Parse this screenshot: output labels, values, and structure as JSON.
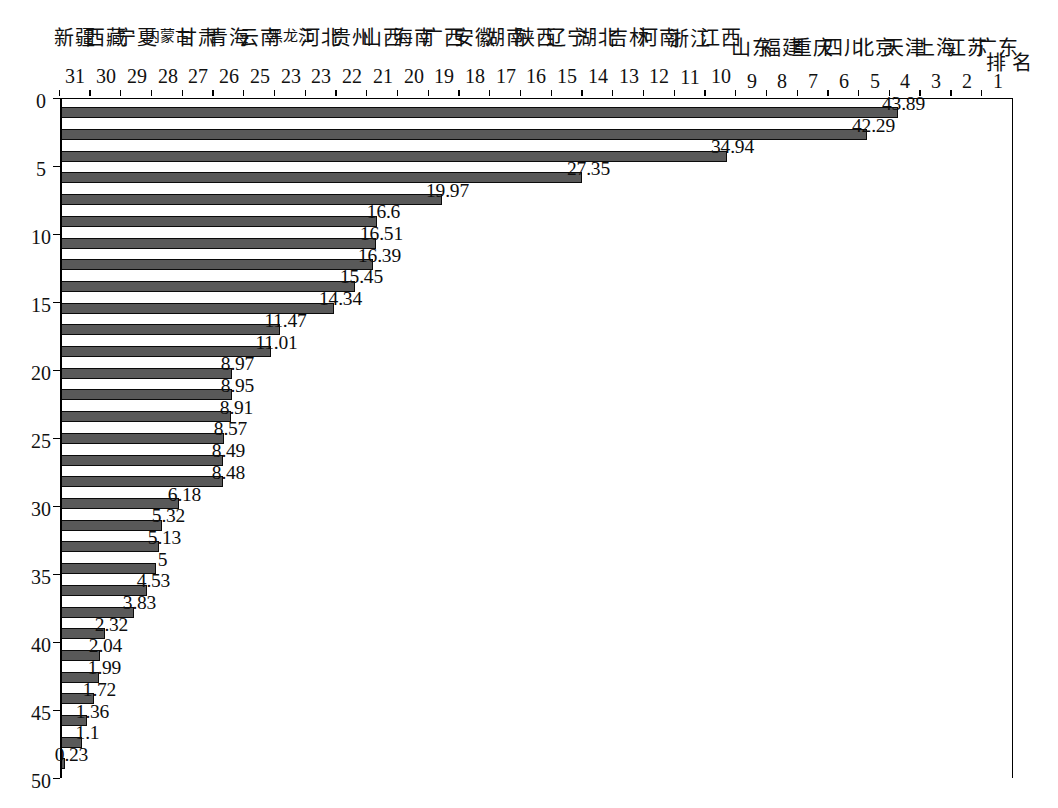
{
  "chart_data": {
    "type": "bar",
    "title": "",
    "orientation": "vertical-rotated-90ccw",
    "xlabel": "排 名",
    "ylabel": "比重（%）",
    "ylim": [
      0,
      50
    ],
    "ytick_step": 5,
    "yticks": [
      "0",
      "5",
      "10",
      "15",
      "20",
      "25",
      "30",
      "35",
      "40",
      "45",
      "50"
    ],
    "grid": false,
    "legend": null,
    "bar_color": "#595959",
    "bar_border_color": "#0b0b0b",
    "ranks": [
      "1",
      "2",
      "3",
      "4",
      "5",
      "6",
      "7",
      "8",
      "9",
      "10",
      "11",
      "12",
      "13",
      "14",
      "15",
      "16",
      "17",
      "18",
      "19",
      "20",
      "21",
      "22",
      "23",
      "23",
      "25",
      "26",
      "27",
      "28",
      "29",
      "30",
      "31"
    ],
    "categories": [
      "广东",
      "江苏",
      "上海",
      "天津",
      "北京",
      "四川",
      "重庆",
      "福建",
      "山东",
      "江西",
      "浙江",
      "河南",
      "吉林",
      "湖北",
      "辽宁",
      "陕西",
      "湖南",
      "安徽",
      "广西",
      "海南",
      "山西",
      "贵州",
      "河北",
      "黑龙江",
      "云南",
      "青海",
      "甘肃",
      "内蒙古",
      "宁夏",
      "西藏",
      "新疆"
    ],
    "values": [
      43.89,
      42.29,
      34.94,
      27.35,
      19.97,
      16.6,
      16.51,
      16.39,
      15.45,
      14.34,
      11.47,
      11.01,
      8.97,
      8.95,
      8.91,
      8.57,
      8.49,
      8.48,
      6.18,
      5.32,
      5.13,
      5,
      4.53,
      3.83,
      2.32,
      2.04,
      1.99,
      1.72,
      1.36,
      1.1,
      0.23
    ],
    "value_labels": [
      "43.89",
      "42.29",
      "34.94",
      "27.35",
      "19.97",
      "16.6",
      "16.51",
      "16.39",
      "15.45",
      "14.34",
      "11.47",
      "11.01",
      "8.97",
      "8.95",
      "8.91",
      "8.57",
      "8.49",
      "8.48",
      "6.18",
      "5.32",
      "5.13",
      "5",
      "4.53",
      "3.83",
      "2.32",
      "2.04",
      "1.99",
      "1.72",
      "1.36",
      "1.1",
      "0.23"
    ]
  }
}
